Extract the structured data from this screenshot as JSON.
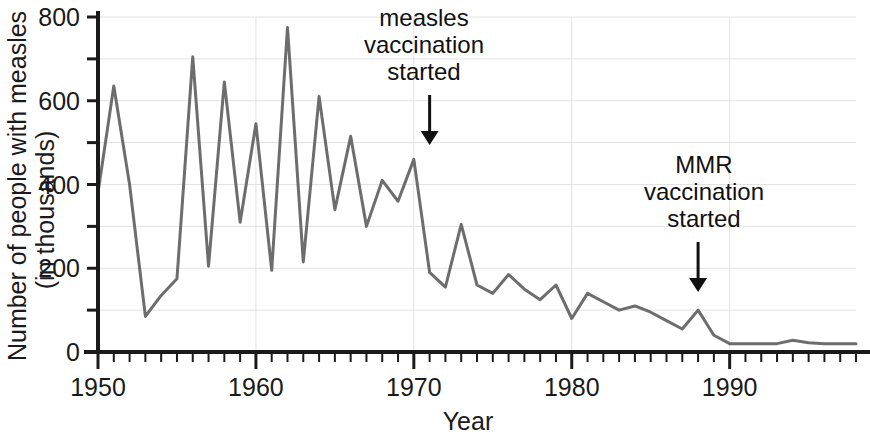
{
  "chart_data": {
    "type": "line",
    "title": "",
    "xlabel": "Year",
    "ylabel": "Number of people with measles (in thousands)",
    "ylabel_line1": "Number of people with measles",
    "ylabel_line2": "(in thousands)",
    "xlim": [
      1950,
      1998
    ],
    "ylim": [
      0,
      800
    ],
    "xticks": [
      1950,
      1960,
      1970,
      1980,
      1990
    ],
    "xtick_labels": [
      "1950",
      "1960",
      "1970",
      "1980",
      "1990"
    ],
    "xtick_minor_step": 1,
    "yticks": [
      0,
      200,
      400,
      600,
      800
    ],
    "ytick_labels": [
      "0",
      "200",
      "400",
      "600",
      "800"
    ],
    "ytick_minor": [
      100,
      300,
      500,
      700
    ],
    "grid": true,
    "grid_color": "#e2e2e2",
    "legend": "none",
    "line_color": "#6d6d6d",
    "line_width": 3,
    "axis_color": "#1a1a1a",
    "x": [
      1950,
      1951,
      1952,
      1953,
      1954,
      1955,
      1956,
      1957,
      1958,
      1959,
      1960,
      1961,
      1962,
      1963,
      1964,
      1965,
      1966,
      1967,
      1968,
      1969,
      1970,
      1971,
      1972,
      1973,
      1974,
      1975,
      1976,
      1977,
      1978,
      1979,
      1980,
      1981,
      1982,
      1983,
      1984,
      1985,
      1986,
      1987,
      1988,
      1989,
      1990,
      1991,
      1992,
      1993,
      1994,
      1995,
      1996,
      1997,
      1998
    ],
    "y": [
      380,
      635,
      400,
      85,
      135,
      175,
      705,
      205,
      645,
      310,
      545,
      195,
      775,
      215,
      610,
      340,
      515,
      300,
      410,
      360,
      460,
      190,
      155,
      305,
      160,
      140,
      185,
      150,
      125,
      160,
      80,
      140,
      120,
      100,
      110,
      95,
      75,
      55,
      100,
      40,
      20,
      20,
      20,
      20,
      28,
      22,
      20,
      20,
      20
    ]
  },
  "annotations": [
    {
      "name": "measles-vaccination",
      "lines": [
        "measles",
        "vaccination",
        "started"
      ],
      "target_year": 1971,
      "arrow": "down-arrow"
    },
    {
      "name": "mmr-vaccination",
      "lines": [
        "MMR",
        "vaccination",
        "started"
      ],
      "target_year": 1988,
      "arrow": "down-arrow"
    }
  ]
}
